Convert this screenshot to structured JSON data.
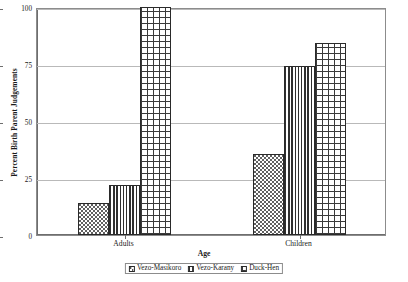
{
  "chart_data": {
    "type": "bar",
    "title": "",
    "xlabel": "Age",
    "ylabel": "Percent Birth Parent Judgements",
    "categories": [
      "Adults",
      "Children"
    ],
    "series": [
      {
        "name": "Vezo-Masikoro",
        "values": [
          14,
          35.5
        ],
        "pattern": "dots"
      },
      {
        "name": "Vezo-Karany",
        "values": [
          22,
          74
        ],
        "pattern": "vertical-stripes"
      },
      {
        "name": "Duck-Hen",
        "values": [
          100,
          84
        ],
        "pattern": "grid"
      }
    ],
    "ylim": [
      0,
      100
    ],
    "yticks": [
      0,
      25,
      50,
      75,
      100
    ],
    "ytick_labels": [
      "0",
      "25",
      "50",
      "75",
      "100"
    ],
    "grid": true,
    "legend_position": "bottom"
  },
  "axes": {
    "y_title": "Percent Birth Parent Judgements",
    "x_title": "Age"
  },
  "colors": {
    "axis": "#6e6e6e",
    "grid": "#b9b9b9",
    "bar_outline": "#2a2a2a",
    "background": "#ffffff"
  }
}
